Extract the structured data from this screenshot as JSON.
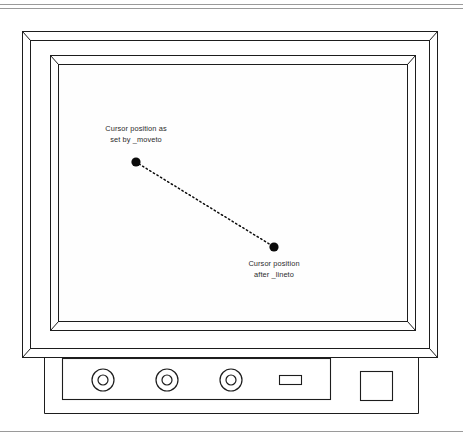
{
  "figure": {
    "background_color": "#ffffff",
    "line_color": "#1d1d1d",
    "rule_color": "#9a9a9a",
    "dot_color": "#0b0b0b",
    "text_color": "#2b2b2b"
  },
  "annotations": {
    "moveto": {
      "line1": "Cursor position as",
      "line2": "set by _moveto",
      "dot_x": 136,
      "dot_y": 162
    },
    "lineto": {
      "line1": "Cursor position",
      "line2": "after _lineto",
      "dot_x": 274,
      "dot_y": 247
    }
  },
  "monitor": {
    "screen_label": "display-screen",
    "controls": {
      "knob_count": 3,
      "knobs": [
        {
          "label": "knob-1",
          "cx": 103,
          "cy": 380
        },
        {
          "label": "knob-2",
          "cx": 167,
          "cy": 380
        },
        {
          "label": "knob-3",
          "cx": 231,
          "cy": 380
        }
      ],
      "slot": {
        "label": "indicator-slot",
        "x": 279,
        "y": 375,
        "w": 22,
        "h": 9
      },
      "power_button": {
        "label": "power-button",
        "x": 360,
        "y": 371,
        "w": 32,
        "h": 29
      }
    }
  }
}
